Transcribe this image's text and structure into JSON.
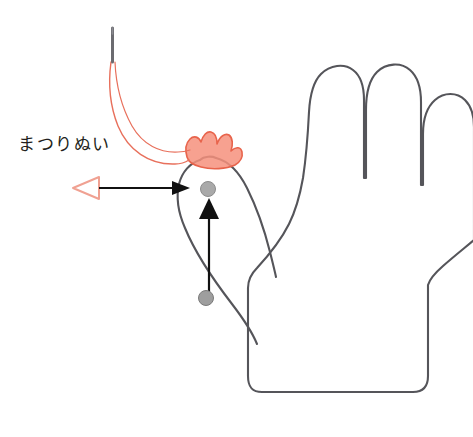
{
  "diagram": {
    "annotation_label": "まつりぬい",
    "colors": {
      "outline": "#55555a",
      "fabric_patch_fill": "#f6917c",
      "fabric_patch_stroke": "#e8644c",
      "thread": "#e8705c",
      "pointer_triangle_stroke": "#f0a192",
      "arrow_black": "#111111",
      "stitch_dot_fill": "#9e9e9e",
      "stitch_dot_stroke": "#7a7a7a",
      "needle": "#6b6b70",
      "background": "#ffffff",
      "text": "#231f20"
    },
    "elements": {
      "glove_outline_name": "glove-outline",
      "thumb_outline_name": "glove-thumb-outline",
      "fabric_patch_name": "fabric-patch",
      "needle_name": "needle",
      "thread_name": "thread",
      "label_arrow_name": "label-arrow",
      "pointer_triangle_name": "pointer-triangle",
      "stitch_arrow_name": "stitch-direction-arrow",
      "stitch_dot_top_name": "stitch-point-upper",
      "stitch_dot_bottom_name": "stitch-point-lower"
    },
    "geometry": {
      "canvas_width": 473,
      "canvas_height": 437,
      "stitch_dot_upper": {
        "cx": 208,
        "cy": 189,
        "r": 7.5
      },
      "stitch_dot_lower": {
        "cx": 206,
        "cy": 298,
        "r": 7.5
      },
      "label_arrow_line": {
        "x1": 99,
        "y1": 188,
        "x2": 186,
        "y2": 188
      },
      "stitch_arrow_line": {
        "x1": 209,
        "y1": 292,
        "x2": 209,
        "y2": 202
      },
      "needle_line": {
        "x1": 112,
        "y1": 28,
        "x2": 112,
        "y2": 62
      }
    }
  }
}
